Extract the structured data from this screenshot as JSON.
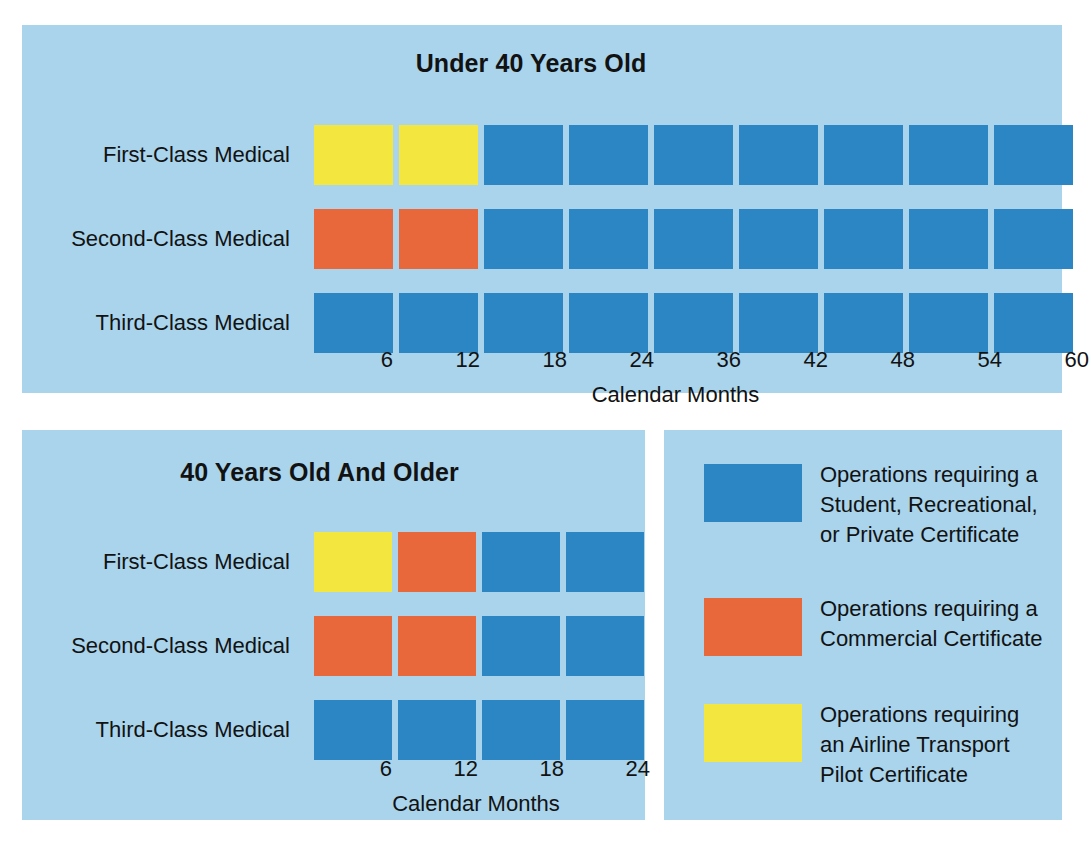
{
  "colors": {
    "panel_background": "#a9d4ec",
    "page_background": "#ffffff",
    "blue": "#2d86c4",
    "orange": "#e8673b",
    "yellow": "#f3e63f",
    "text": "#121212"
  },
  "chart_data": [
    {
      "type": "bar",
      "title": "Under 40 Years Old",
      "xlabel": "Calendar Months",
      "ylabel": "",
      "categories": [
        "First-Class Medical",
        "Second-Class Medical",
        "Third-Class Medical"
      ],
      "x": [
        6,
        12,
        18,
        24,
        36,
        42,
        48,
        54,
        60
      ],
      "tick_labels": [
        "6",
        "12",
        "18",
        "24",
        "36",
        "42",
        "48",
        "54",
        "60"
      ],
      "xlim": [
        0,
        60
      ],
      "grid": false,
      "legend_position": "right-panel",
      "series": [
        {
          "name": "First-Class Medical",
          "values": [
            "yellow",
            "yellow",
            "blue",
            "blue",
            "blue",
            "blue",
            "blue",
            "blue",
            "blue"
          ]
        },
        {
          "name": "Second-Class Medical",
          "values": [
            "orange",
            "orange",
            "blue",
            "blue",
            "blue",
            "blue",
            "blue",
            "blue",
            "blue"
          ]
        },
        {
          "name": "Third-Class Medical",
          "values": [
            "blue",
            "blue",
            "blue",
            "blue",
            "blue",
            "blue",
            "blue",
            "blue",
            "blue"
          ]
        }
      ]
    },
    {
      "type": "bar",
      "title": "40 Years Old And Older",
      "xlabel": "Calendar Months",
      "ylabel": "",
      "categories": [
        "First-Class Medical",
        "Second-Class Medical",
        "Third-Class Medical"
      ],
      "x": [
        6,
        12,
        18,
        24
      ],
      "tick_labels": [
        "6",
        "12",
        "18",
        "24"
      ],
      "xlim": [
        0,
        24
      ],
      "grid": false,
      "legend_position": "right-panel",
      "series": [
        {
          "name": "First-Class Medical",
          "values": [
            "yellow",
            "orange",
            "blue",
            "blue"
          ]
        },
        {
          "name": "Second-Class Medical",
          "values": [
            "orange",
            "orange",
            "blue",
            "blue"
          ]
        },
        {
          "name": "Third-Class Medical",
          "values": [
            "blue",
            "blue",
            "blue",
            "blue"
          ]
        }
      ]
    }
  ],
  "top_chart": {
    "title": "Under 40 Years Old",
    "axis_label": "Calendar Months",
    "rows": [
      {
        "label": "First-Class Medical",
        "cells": [
          "yellow",
          "yellow",
          "blue",
          "blue",
          "blue",
          "blue",
          "blue",
          "blue",
          "blue"
        ]
      },
      {
        "label": "Second-Class Medical",
        "cells": [
          "orange",
          "orange",
          "blue",
          "blue",
          "blue",
          "blue",
          "blue",
          "blue",
          "blue"
        ]
      },
      {
        "label": "Third-Class Medical",
        "cells": [
          "blue",
          "blue",
          "blue",
          "blue",
          "blue",
          "blue",
          "blue",
          "blue",
          "blue"
        ]
      }
    ],
    "ticks": [
      "6",
      "12",
      "18",
      "24",
      "36",
      "42",
      "48",
      "54",
      "60"
    ]
  },
  "bottom_chart": {
    "title": "40 Years Old And Older",
    "axis_label": "Calendar Months",
    "rows": [
      {
        "label": "First-Class Medical",
        "cells": [
          "yellow",
          "orange",
          "blue",
          "blue"
        ]
      },
      {
        "label": "Second-Class Medical",
        "cells": [
          "orange",
          "orange",
          "blue",
          "blue"
        ]
      },
      {
        "label": "Third-Class Medical",
        "cells": [
          "blue",
          "blue",
          "blue",
          "blue"
        ]
      }
    ],
    "ticks": [
      "6",
      "12",
      "18",
      "24"
    ]
  },
  "legend": {
    "items": [
      {
        "color": "blue",
        "text": "Operations requiring a\nStudent, Recreational,\nor Private Certificate"
      },
      {
        "color": "orange",
        "text": "Operations requiring a\nCommercial Certificate"
      },
      {
        "color": "yellow",
        "text": "Operations requiring\nan Airline Transport\nPilot Certificate"
      }
    ]
  }
}
